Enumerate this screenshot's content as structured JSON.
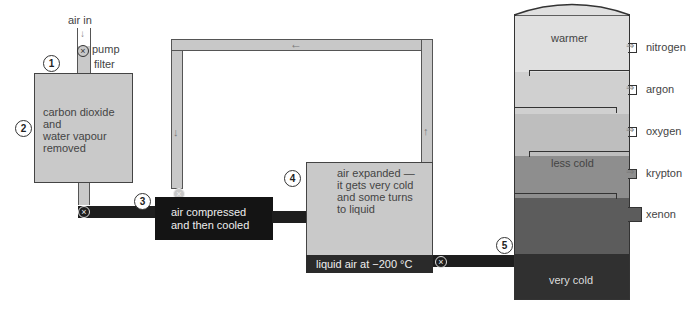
{
  "diagram": {
    "stages": [
      {
        "number": "1",
        "labels": [
          "air in",
          "pump",
          "filter"
        ]
      },
      {
        "number": "2",
        "text": "carbon dioxide and water vapour removed"
      },
      {
        "number": "3",
        "text": "air compressed and then cooled"
      },
      {
        "number": "4",
        "text": "air expanded — it gets very cold and some turns to liquid"
      },
      {
        "number": "5",
        "text": "fractionating column"
      }
    ],
    "intake": {
      "air_in": "air in",
      "pump": "pump",
      "filter": "filter"
    },
    "tank": {
      "line1": "carbon dioxide",
      "line2": "and",
      "line3": "water vapour",
      "line4": "removed"
    },
    "compressor": {
      "line1": "air compressed",
      "line2": "and then cooled"
    },
    "expander": {
      "line1": "air expanded —",
      "line2": "it gets very cold",
      "line3": "and some turns",
      "line4": "to liquid",
      "liquid": "liquid air at −200 °C"
    },
    "column": {
      "top_label": "warmer",
      "middle_label": "less cold",
      "bottom_label": "very cold",
      "outlets": [
        "nitrogen",
        "argon",
        "oxygen",
        "krypton",
        "xenon"
      ],
      "layer_colors": [
        "#dcdcdc",
        "#cfcfcf",
        "#bdbdbd",
        "#8a8a8a",
        "#5e5e5e",
        "#333333"
      ]
    },
    "colors": {
      "pipe_dark": "#1e1e1e",
      "pipe_gray": "#c8c8c8",
      "outline": "#444444"
    }
  }
}
